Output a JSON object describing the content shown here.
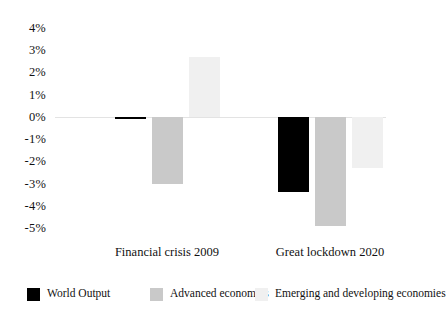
{
  "chart_data": {
    "type": "bar",
    "title": "",
    "subtitle": "",
    "xlabel": "",
    "ylabel": "",
    "categories": [
      "Financial crisis 2009",
      "Great lockdown 2020"
    ],
    "series": [
      {
        "name": "World Output",
        "color": "#000000",
        "values": [
          -0.1,
          -3.4
        ]
      },
      {
        "name": "Advanced economies",
        "color": "#c9c9c9",
        "values": [
          -3.0,
          -4.9
        ]
      },
      {
        "name": "Emerging and developing economies",
        "color": "#f0f0f0",
        "values": [
          2.7,
          -2.3
        ]
      }
    ],
    "ylim": [
      -5,
      4
    ],
    "ytick_values": [
      4,
      3,
      2,
      1,
      0,
      -1,
      -2,
      -3,
      -4,
      -5
    ],
    "ytick_labels": [
      "4%",
      "3%",
      "2%",
      "1%",
      "0%",
      "-1%",
      "-2%",
      "-3%",
      "-4%",
      "-5%"
    ],
    "grid": false,
    "zero_line": true,
    "legend_position": "bottom"
  },
  "legend": {
    "items": [
      {
        "label": "World Output",
        "color": "#000000"
      },
      {
        "label": "Advanced economies",
        "color": "#c9c9c9"
      },
      {
        "label": "Emerging and developing economies",
        "color": "#f0f0f0"
      }
    ]
  }
}
